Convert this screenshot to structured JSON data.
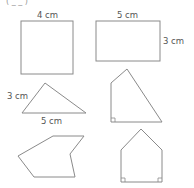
{
  "header": {
    "cut_text": "(  _ _                    )"
  },
  "shapes": {
    "square": {
      "label_top": "4 cm"
    },
    "rectangle": {
      "label_top": "5 cm",
      "label_right": "3 cm"
    },
    "triangle": {
      "label_left": "3 cm",
      "label_bottom": "5 cm"
    },
    "quadrilateral": {
      "right_angle_marks": 1
    },
    "irregular_hexagon": {},
    "house_pentagon": {
      "right_angle_marks": 2
    }
  },
  "colors": {
    "stroke": "#8a8a8a",
    "text": "#555555",
    "background": "#ffffff"
  }
}
